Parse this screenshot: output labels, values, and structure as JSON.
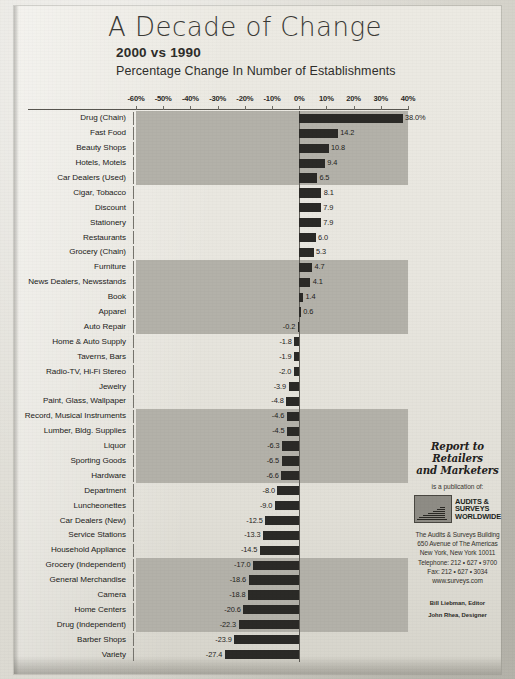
{
  "header": {
    "title": "A Decade of Change",
    "subtitle": "2000 vs 1990",
    "subtitle2": "Percentage Change In Number of Establishments"
  },
  "sidebar": {
    "report_title_line1": "Report to Retailers",
    "report_title_line2": "and Marketers",
    "publication_of": "is a publication of:",
    "logo_line1": "AUDITS &",
    "logo_line2": "SURVEYS",
    "logo_line3": "WORLDWIDE",
    "address": [
      "The Audits & Surveys Building",
      "650 Avenue of The Americas",
      "New York, New York 10011",
      "Telephone: 212 • 627 • 9700",
      "Fax: 212 • 627 • 3034",
      "www.surveys.com"
    ],
    "credits": [
      "Bill Liebman, Editor",
      "John Rhea, Designer"
    ]
  },
  "chart_data": {
    "type": "bar",
    "orientation": "horizontal",
    "title": "A Decade of Change",
    "subtitle": "2000 vs 1990 — Percentage Change In Number of Establishments",
    "xlabel": "",
    "ylabel": "",
    "xlim": [
      -60,
      40
    ],
    "grid": false,
    "legend": null,
    "tick_labels": [
      "-60%",
      "-50%",
      "-40%",
      "-30%",
      "-20%",
      "-10%",
      "0%",
      "10%",
      "20%",
      "30%",
      "40%"
    ],
    "tick_values": [
      -60,
      -50,
      -40,
      -30,
      -20,
      -10,
      0,
      10,
      20,
      30,
      40
    ],
    "bar_color": "#2b2a27",
    "band_color": "#b3b1a9",
    "categories": [
      "Drug (Chain)",
      "Fast Food",
      "Beauty Shops",
      "Hotels, Motels",
      "Car Dealers (Used)",
      "Cigar, Tobacco",
      "Discount",
      "Stationery",
      "Restaurants",
      "Grocery (Chain)",
      "Furniture",
      "News Dealers, Newsstands",
      "Book",
      "Apparel",
      "Auto Repair",
      "Home & Auto Supply",
      "Taverns, Bars",
      "Radio-TV, Hi-Fi Stereo",
      "Jewelry",
      "Paint, Glass, Wallpaper",
      "Record, Musical Instruments",
      "Lumber, Bldg. Supplies",
      "Liquor",
      "Sporting Goods",
      "Hardware",
      "Department",
      "Luncheonettes",
      "Car Dealers (New)",
      "Service Stations",
      "Household Appliance",
      "Grocery (Independent)",
      "General Merchandise",
      "Camera",
      "Home Centers",
      "Drug (Independent)",
      "Barber Shops",
      "Variety"
    ],
    "values": [
      38.0,
      14.2,
      10.8,
      9.4,
      6.5,
      8.1,
      7.9,
      7.9,
      6.0,
      5.3,
      4.7,
      4.1,
      1.4,
      0.6,
      -0.2,
      -1.8,
      -1.9,
      -2.0,
      -3.9,
      -4.8,
      -4.6,
      -4.5,
      -6.3,
      -6.5,
      -6.6,
      -8.0,
      -9.0,
      -12.5,
      -13.3,
      -14.5,
      -17.0,
      -18.6,
      -18.8,
      -20.6,
      -22.3,
      -23.9,
      -27.4
    ],
    "value_labels": [
      "38.0%",
      "14.2",
      "10.8",
      "9.4",
      "6.5",
      "8.1",
      "7.9",
      "7.9",
      "6.0",
      "5.3",
      "4.7",
      "4.1",
      "1.4",
      "0.6",
      "-0.2",
      "-1.8",
      "-1.9",
      "-2.0",
      "-3.9",
      "-4.8",
      "-4.6",
      "-4.5",
      "-6.3",
      "-6.5",
      "-6.6",
      "-8.0",
      "-9.0",
      "-12.5",
      "-13.3",
      "-14.5",
      "-17.0",
      "-18.6",
      "-18.8",
      "-20.6",
      "-22.3",
      "-23.9",
      "-27.4"
    ],
    "bands": [
      {
        "start": 0,
        "end": 4
      },
      {
        "start": 10,
        "end": 14
      },
      {
        "start": 20,
        "end": 24
      },
      {
        "start": 30,
        "end": 34
      }
    ]
  }
}
